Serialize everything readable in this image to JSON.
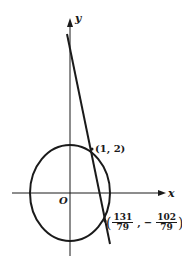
{
  "diagram": {
    "axes": {
      "x_label": "x",
      "y_label": "y",
      "origin_label": "O"
    },
    "ellipse": {
      "center": [
        0,
        0
      ],
      "semi_axis_x": "a",
      "semi_axis_y": "b"
    },
    "line": {
      "description": "steep line with negative slope crossing the ellipse"
    },
    "points": [
      {
        "label": "(1, 2)"
      },
      {
        "label_open": "(",
        "x_num": "131",
        "x_den": "79",
        "sep": ",",
        "minus": "−",
        "y_num": "102",
        "y_den": "79",
        "label_close": ")"
      }
    ],
    "colors": {
      "stroke": "#1a1a1a",
      "background": "#ffffff"
    }
  }
}
